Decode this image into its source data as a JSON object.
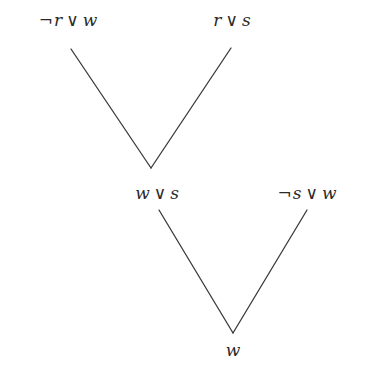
{
  "diagram": {
    "type": "resolution-tree",
    "nodes": [
      {
        "id": "n1",
        "label": "¬r ∨ w",
        "parts": {
          "neg1": "¬",
          "lit1": "r",
          "op": "∨",
          "neg2": "",
          "lit2": "w"
        },
        "x": 68,
        "y": 20
      },
      {
        "id": "n2",
        "label": "r ∨ s",
        "parts": {
          "neg1": "",
          "lit1": "r",
          "op": "∨",
          "neg2": "",
          "lit2": "s"
        },
        "x": 232,
        "y": 20
      },
      {
        "id": "n3",
        "label": "w ∨ s",
        "parts": {
          "neg1": "",
          "lit1": "w",
          "op": "∨",
          "neg2": "",
          "lit2": "s"
        },
        "x": 157,
        "y": 193
      },
      {
        "id": "n4",
        "label": "¬s ∨ w",
        "parts": {
          "neg1": "¬",
          "lit1": "s",
          "op": "∨",
          "neg2": "",
          "lit2": "w"
        },
        "x": 307,
        "y": 193
      },
      {
        "id": "n5",
        "label": "w",
        "parts": {
          "neg1": "",
          "lit1": "w",
          "op": "",
          "neg2": "",
          "lit2": ""
        },
        "x": 233,
        "y": 350
      }
    ],
    "edges": [
      {
        "from": "n1",
        "to": "n3",
        "x1": 71,
        "y1": 49,
        "x2": 151,
        "y2": 168
      },
      {
        "from": "n2",
        "to": "n3",
        "x1": 231,
        "y1": 48,
        "x2": 151,
        "y2": 168
      },
      {
        "from": "n3",
        "to": "n5",
        "x1": 159,
        "y1": 210,
        "x2": 233,
        "y2": 333
      },
      {
        "from": "n4",
        "to": "n5",
        "x1": 307,
        "y1": 210,
        "x2": 233,
        "y2": 333
      }
    ],
    "colors": {
      "line": "#3a3a3a",
      "text": "#2a2a2a",
      "background": "#ffffff"
    }
  }
}
